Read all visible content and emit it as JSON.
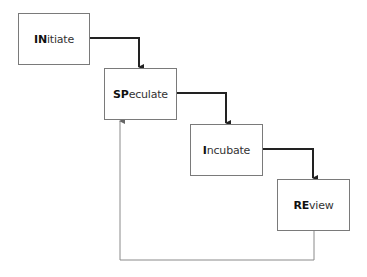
{
  "diagram": {
    "type": "flow-cycle",
    "colors": {
      "box_border": "#7a7a7a",
      "forward_arrow": "#222222",
      "feedback_line": "#8a8a8a",
      "text": "#333333"
    },
    "stages": [
      {
        "id": "initiate",
        "bold": "IN",
        "rest": "itiate"
      },
      {
        "id": "speculate",
        "bold": "SP",
        "rest": "eculate"
      },
      {
        "id": "incubate",
        "bold": "I",
        "rest": "ncubate"
      },
      {
        "id": "review",
        "bold": "RE",
        "rest": "view"
      }
    ],
    "edges": [
      {
        "from": "initiate",
        "to": "speculate",
        "style": "thick"
      },
      {
        "from": "speculate",
        "to": "incubate",
        "style": "thick"
      },
      {
        "from": "incubate",
        "to": "review",
        "style": "thick"
      },
      {
        "from": "review",
        "to": "speculate",
        "style": "thin-feedback"
      }
    ]
  }
}
